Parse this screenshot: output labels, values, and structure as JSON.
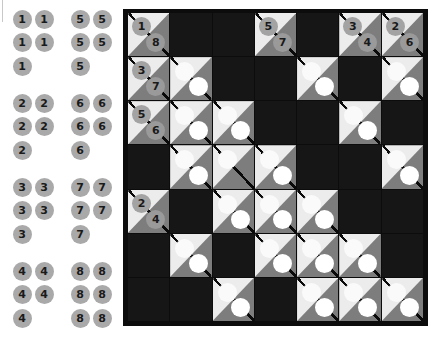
{
  "tray": {
    "groups": [
      {
        "top": 19,
        "columns": [
          {
            "x": 22,
            "value": "1",
            "rows": 3
          },
          {
            "x": 44,
            "value": "1",
            "rows": 2
          },
          {
            "x": 80,
            "value": "5",
            "rows": 3
          },
          {
            "x": 102,
            "value": "5",
            "rows": 2
          }
        ]
      },
      {
        "top": 103,
        "columns": [
          {
            "x": 22,
            "value": "2",
            "rows": 3
          },
          {
            "x": 44,
            "value": "2",
            "rows": 2
          },
          {
            "x": 80,
            "value": "6",
            "rows": 3
          },
          {
            "x": 102,
            "value": "6",
            "rows": 2
          }
        ]
      },
      {
        "top": 187,
        "columns": [
          {
            "x": 22,
            "value": "3",
            "rows": 3
          },
          {
            "x": 44,
            "value": "3",
            "rows": 2
          },
          {
            "x": 80,
            "value": "7",
            "rows": 3
          },
          {
            "x": 102,
            "value": "7",
            "rows": 2
          }
        ]
      },
      {
        "top": 271,
        "columns": [
          {
            "x": 22,
            "value": "4",
            "rows": 3
          },
          {
            "x": 44,
            "value": "4",
            "rows": 2
          },
          {
            "x": 80,
            "value": "8",
            "rows": 3
          },
          {
            "x": 102,
            "value": "8",
            "rows": 3
          }
        ]
      }
    ],
    "row_spacing": 23.5
  },
  "board": {
    "rows": 7,
    "cols": 7,
    "cells": [
      [
        {
          "t": "clue",
          "up": "1",
          "down": "8"
        },
        {
          "t": "black"
        },
        {
          "t": "black"
        },
        {
          "t": "clue",
          "up": "5",
          "down": "7"
        },
        {
          "t": "black"
        },
        {
          "t": "clue",
          "up": "3",
          "down": "4"
        },
        {
          "t": "clue",
          "up": "2",
          "down": "6"
        }
      ],
      [
        {
          "t": "clue",
          "up": "3",
          "down": "7"
        },
        {
          "t": "empty"
        },
        {
          "t": "black"
        },
        {
          "t": "black"
        },
        {
          "t": "empty"
        },
        {
          "t": "black"
        },
        {
          "t": "empty"
        }
      ],
      [
        {
          "t": "clue",
          "up": "5",
          "down": "6"
        },
        {
          "t": "empty"
        },
        {
          "t": "empty"
        },
        {
          "t": "black"
        },
        {
          "t": "black"
        },
        {
          "t": "empty"
        },
        {
          "t": "black"
        }
      ],
      [
        {
          "t": "black"
        },
        {
          "t": "empty"
        },
        {
          "t": "upper-only"
        },
        {
          "t": "empty"
        },
        {
          "t": "black"
        },
        {
          "t": "black"
        },
        {
          "t": "empty"
        }
      ],
      [
        {
          "t": "clue",
          "up": "2",
          "down": "4"
        },
        {
          "t": "black"
        },
        {
          "t": "empty"
        },
        {
          "t": "empty"
        },
        {
          "t": "empty"
        },
        {
          "t": "black"
        },
        {
          "t": "black"
        }
      ],
      [
        {
          "t": "black"
        },
        {
          "t": "empty"
        },
        {
          "t": "black"
        },
        {
          "t": "empty"
        },
        {
          "t": "empty"
        },
        {
          "t": "empty"
        },
        {
          "t": "black"
        }
      ],
      [
        {
          "t": "black"
        },
        {
          "t": "black"
        },
        {
          "t": "empty"
        },
        {
          "t": "black"
        },
        {
          "t": "empty"
        },
        {
          "t": "empty"
        },
        {
          "t": "empty"
        }
      ]
    ]
  },
  "colors": {
    "board_border": "#0c0c0c",
    "black_cell": "#161616",
    "upper_triangle": "#ececec",
    "lower_triangle": "#7d7d7d",
    "token": "#a9a9a9",
    "slot": "#ffffff"
  }
}
